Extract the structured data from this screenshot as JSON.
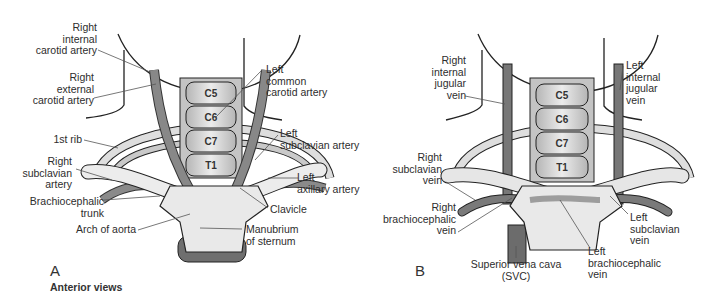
{
  "figure": {
    "caption": "Anterior views",
    "panels": [
      {
        "letter": "A",
        "topic": "arteries",
        "vertebrae": [
          "C5",
          "C6",
          "C7",
          "T1"
        ],
        "labels": {
          "right_internal_carotid": "Right\ninternal\ncarotid artery",
          "right_external_carotid": "Right\nexternal\ncarotid artery",
          "first_rib": "1st rib",
          "right_subclavian_artery": "Right\nsubclavian\nartery",
          "brachiocephalic_trunk": "Brachiocephalic\ntrunk",
          "arch_of_aorta": "Arch of aorta",
          "left_common_carotid": "Left\ncommon\ncarotid artery",
          "left_subclavian_artery": "Left\nsubclavian artery",
          "left_axillary_artery": "Left\naxillary artery",
          "clavicle": "Clavicle",
          "manubrium": "Manubrium\nof sternum"
        }
      },
      {
        "letter": "B",
        "topic": "veins",
        "vertebrae": [
          "C5",
          "C6",
          "C7",
          "T1"
        ],
        "labels": {
          "right_internal_jugular": "Right\ninternal\njugular\nvein",
          "left_internal_jugular": "Left\ninternal\njugular\nvein",
          "right_subclavian_vein": "Right\nsubclavian\nvein",
          "right_brachiocephalic_vein": "Right\nbrachiocephalic\nvein",
          "svc": "Superior vena cava\n(SVC)",
          "left_brachiocephalic_vein": "Left\nbrachiocephalic\nvein",
          "left_subclavian_vein": "Left\nsubclavian\nvein"
        }
      }
    ],
    "colors": {
      "outline": "#222222",
      "vessel": "#7d7d7d",
      "bone": "#dcdcdc",
      "bone_dark": "#a9a9a9",
      "sternum": "#e8e8e8",
      "leader": "#555555"
    }
  }
}
